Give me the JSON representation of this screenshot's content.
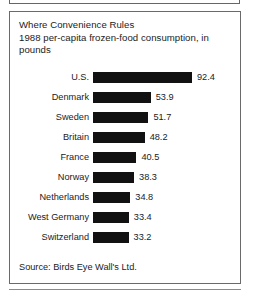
{
  "figure": {
    "title_line_1": "Where Convenience Rules",
    "title_line_2": "1988 per-capita frozen-food consumption, in",
    "title_line_3": "pounds",
    "source": "Source: Birds Eye Wall's Ltd.",
    "bar_color": "#111111",
    "border_color": "#6a6a6a",
    "text_color": "#1b1b1b"
  },
  "chart_data": {
    "type": "bar",
    "orientation": "horizontal",
    "title": "Where Convenience Rules",
    "subtitle": "1988 per-capita frozen-food consumption, in pounds",
    "xlabel": "",
    "ylabel": "",
    "grid": false,
    "legend": false,
    "xlim": [
      0,
      92.4
    ],
    "value_unit": "pounds",
    "categories": [
      "U.S.",
      "Denmark",
      "Sweden",
      "Britain",
      "France",
      "Norway",
      "Netherlands",
      "West Germany",
      "Switzerland"
    ],
    "values": [
      92.4,
      53.9,
      51.7,
      48.2,
      40.5,
      38.3,
      34.8,
      33.4,
      33.2
    ],
    "value_labels": [
      "92.4",
      "53.9",
      "51.7",
      "48.2",
      "40.5",
      "38.3",
      "34.8",
      "33.4",
      "33.2"
    ],
    "source": "Source: Birds Eye Wall's Ltd.",
    "bars": [
      {
        "label": "U.S.",
        "value": 92.4,
        "value_label": "92.4"
      },
      {
        "label": "Denmark",
        "value": 53.9,
        "value_label": "53.9"
      },
      {
        "label": "Sweden",
        "value": 51.7,
        "value_label": "51.7"
      },
      {
        "label": "Britain",
        "value": 48.2,
        "value_label": "48.2"
      },
      {
        "label": "France",
        "value": 40.5,
        "value_label": "40.5"
      },
      {
        "label": "Norway",
        "value": 38.3,
        "value_label": "38.3"
      },
      {
        "label": "Netherlands",
        "value": 34.8,
        "value_label": "34.8"
      },
      {
        "label": "West Germany",
        "value": 33.4,
        "value_label": "33.4"
      },
      {
        "label": "Switzerland",
        "value": 33.2,
        "value_label": "33.2"
      }
    ]
  }
}
